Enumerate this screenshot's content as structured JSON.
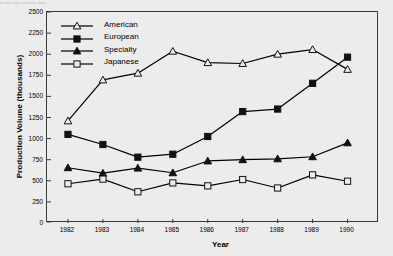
{
  "topstrip": "production volume data",
  "chart_data": {
    "type": "line",
    "title": "",
    "xlabel": "Year",
    "ylabel": "Production Volume (thousands)",
    "categories": [
      "1982",
      "1983",
      "1984",
      "1985",
      "1986",
      "1987",
      "1988",
      "1989",
      "1990"
    ],
    "x": [
      1982,
      1983,
      1984,
      1985,
      1986,
      1987,
      1988,
      1989,
      1990
    ],
    "xlim": [
      1981.4,
      1990.9
    ],
    "ylim": [
      0,
      2500
    ],
    "yticks": [
      0,
      250,
      500,
      750,
      1000,
      1250,
      1500,
      1750,
      2000,
      2250,
      2500
    ],
    "ytick_labels": [
      "0",
      "250",
      "500",
      "750",
      "1000",
      "1250",
      "1500",
      "1750",
      "2000",
      "2250",
      "2500"
    ],
    "grid": false,
    "legend_position": "upper-left-inside",
    "series": [
      {
        "name": "American",
        "marker": "open-triangle",
        "color": "#000000",
        "values": [
          1210,
          1695,
          1775,
          2035,
          1900,
          1890,
          2000,
          2055,
          1820
        ]
      },
      {
        "name": "European",
        "marker": "filled-square",
        "color": "#000000",
        "values": [
          1050,
          930,
          780,
          815,
          1025,
          1320,
          1350,
          1655,
          1965
        ]
      },
      {
        "name": "Specialty",
        "marker": "filled-triangle",
        "color": "#000000",
        "values": [
          655,
          590,
          650,
          595,
          735,
          750,
          760,
          785,
          950
        ]
      },
      {
        "name": "Japanese",
        "marker": "open-square",
        "color": "#000000",
        "values": [
          465,
          520,
          370,
          475,
          440,
          515,
          415,
          570,
          495
        ]
      }
    ]
  }
}
